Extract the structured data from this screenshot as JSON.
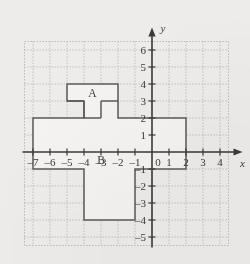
{
  "figure": {
    "type": "coordinate-grid-polygon",
    "background_color": "#eeecea",
    "grid_color": "#b9b7b5",
    "axis_color": "#3a3a3a",
    "shape_stroke": "#5a5a5a",
    "shape_fill": "#f4f3f1",
    "geometry": {
      "origin_px": [
        152,
        152
      ],
      "unit_px": 17,
      "grid_x_range": [
        -7.5,
        4.5
      ],
      "grid_y_range": [
        -5.5,
        6.5
      ]
    },
    "axes": {
      "x_axis_label": "x",
      "y_axis_label": "y",
      "origin_label": "0",
      "x_ticks": [
        {
          "value": -7,
          "label": "–7"
        },
        {
          "value": -6,
          "label": "–6"
        },
        {
          "value": -5,
          "label": "–5"
        },
        {
          "value": -4,
          "label": "–4"
        },
        {
          "value": -3,
          "label": "–3"
        },
        {
          "value": -2,
          "label": "–2"
        },
        {
          "value": -1,
          "label": "–1"
        },
        {
          "value": 1,
          "label": "1"
        },
        {
          "value": 2,
          "label": "2"
        },
        {
          "value": 3,
          "label": "3"
        },
        {
          "value": 4,
          "label": "4"
        }
      ],
      "y_ticks": [
        {
          "value": 6,
          "label": "6"
        },
        {
          "value": 5,
          "label": "5"
        },
        {
          "value": 4,
          "label": "4"
        },
        {
          "value": 3,
          "label": "3"
        },
        {
          "value": 2,
          "label": "2"
        },
        {
          "value": 1,
          "label": "1"
        },
        {
          "value": -1,
          "label": "–1"
        },
        {
          "value": -2,
          "label": "–2"
        },
        {
          "value": -3,
          "label": "–3"
        },
        {
          "value": -4,
          "label": "–4"
        },
        {
          "value": -5,
          "label": "–5"
        }
      ]
    },
    "polygon": {
      "name": "compound-figure-outline",
      "vertices": [
        [
          -5,
          4
        ],
        [
          -2,
          4
        ],
        [
          -2,
          3
        ],
        [
          -2,
          2
        ],
        [
          2,
          2
        ],
        [
          2,
          -1
        ],
        [
          -1,
          -1
        ],
        [
          -1,
          -4
        ],
        [
          -4,
          -4
        ],
        [
          -4,
          -1
        ],
        [
          -7,
          -1
        ],
        [
          -7,
          2
        ],
        [
          -4,
          2
        ],
        [
          -4,
          3
        ],
        [
          -5,
          3
        ]
      ]
    },
    "internal_segments": [
      {
        "name": "segment-A-bottom-left",
        "from": [
          -5,
          3
        ],
        "to": [
          -4,
          3
        ]
      },
      {
        "name": "segment-A-bottom-right",
        "from": [
          -3,
          3
        ],
        "to": [
          -2,
          3
        ]
      },
      {
        "name": "segment-A-leg-inner-left",
        "from": [
          -4,
          3
        ],
        "to": [
          -4,
          2
        ]
      },
      {
        "name": "segment-A-leg-inner-right",
        "from": [
          -3,
          3
        ],
        "to": [
          -3,
          2
        ]
      },
      {
        "name": "segment-A-notch-bottom",
        "from": [
          -4,
          2
        ],
        "to": [
          -3,
          2
        ]
      }
    ],
    "region_labels": [
      {
        "name": "region-label-a",
        "text": "A",
        "x": -3.5,
        "y": 3.5
      },
      {
        "name": "region-label-b",
        "text": "B",
        "x": -3.0,
        "y": -0.45
      }
    ]
  }
}
